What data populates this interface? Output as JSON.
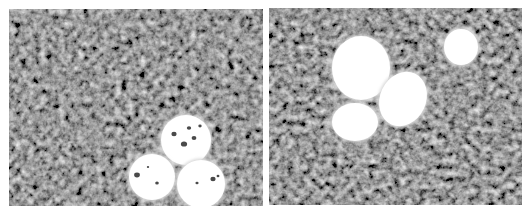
{
  "figure": {
    "background_color": "#3a3a3a",
    "particle_color": "#ffffff",
    "panels": [
      {
        "id": "left",
        "x": 9,
        "y": 9,
        "width": 254,
        "height": 197,
        "particles": [
          {
            "cx": 177,
            "cy": 131,
            "rx": 25,
            "ry": 25,
            "rotate": 0,
            "pits": [
              [
                -12,
                -6,
                2.2
              ],
              [
                3,
                -12,
                1.8
              ],
              [
                8,
                -2,
                2
              ],
              [
                -2,
                4,
                2.6
              ],
              [
                14,
                -14,
                1.4
              ]
            ]
          },
          {
            "cx": 143,
            "cy": 168,
            "rx": 23,
            "ry": 23,
            "rotate": 0,
            "pits": [
              [
                -15,
                -2,
                2.4
              ],
              [
                5,
                6,
                1.5
              ],
              [
                -4,
                -10,
                1
              ]
            ]
          },
          {
            "cx": 192,
            "cy": 175,
            "rx": 24,
            "ry": 24,
            "rotate": 0,
            "pits": [
              [
                12,
                -5,
                2.2
              ],
              [
                -4,
                -1,
                1.3
              ],
              [
                17,
                -8,
                1.2
              ]
            ]
          }
        ]
      },
      {
        "id": "right",
        "x": 269,
        "y": 8,
        "width": 253,
        "height": 197,
        "particles": [
          {
            "cx": 92,
            "cy": 60,
            "rx": 29,
            "ry": 32,
            "rotate": 0,
            "pits": []
          },
          {
            "cx": 134,
            "cy": 91,
            "rx": 23,
            "ry": 28,
            "rotate": 25,
            "pits": []
          },
          {
            "cx": 86,
            "cy": 114,
            "rx": 23,
            "ry": 19,
            "rotate": 0,
            "pits": []
          },
          {
            "cx": 192,
            "cy": 39,
            "rx": 17,
            "ry": 18,
            "rotate": 0,
            "pits": []
          }
        ]
      }
    ]
  }
}
